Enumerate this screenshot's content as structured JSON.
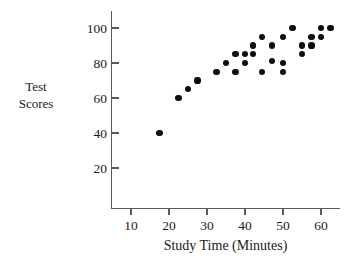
{
  "chart_data": {
    "type": "scatter",
    "title": "",
    "xlabel": "Study Time (Minutes)",
    "ylabel": "Test Scores",
    "ylabel_lines": [
      "Test",
      "Scores"
    ],
    "xlim": [
      0,
      64
    ],
    "ylim": [
      0,
      108
    ],
    "xticks": [
      10,
      20,
      30,
      40,
      50,
      60
    ],
    "xtick_labels": [
      "10",
      "20",
      "30",
      "40",
      "50",
      "60"
    ],
    "yticks": [
      20,
      40,
      60,
      80,
      100
    ],
    "ytick_labels": [
      "20",
      "40",
      "60",
      "80",
      "100"
    ],
    "grid": false,
    "legend": null,
    "marker": "filled-circle",
    "marker_color": "#0d0d0d",
    "axis_color": "#5a5a5a",
    "points": [
      {
        "x": 17.5,
        "y": 40
      },
      {
        "x": 22.5,
        "y": 60
      },
      {
        "x": 25,
        "y": 65
      },
      {
        "x": 27.5,
        "y": 70
      },
      {
        "x": 32.5,
        "y": 75
      },
      {
        "x": 35,
        "y": 80
      },
      {
        "x": 37.5,
        "y": 85
      },
      {
        "x": 37.5,
        "y": 75
      },
      {
        "x": 40,
        "y": 85
      },
      {
        "x": 40,
        "y": 80
      },
      {
        "x": 42,
        "y": 85
      },
      {
        "x": 42,
        "y": 90
      },
      {
        "x": 44.5,
        "y": 95
      },
      {
        "x": 44.5,
        "y": 75
      },
      {
        "x": 47,
        "y": 90
      },
      {
        "x": 47,
        "y": 81
      },
      {
        "x": 50,
        "y": 95
      },
      {
        "x": 50,
        "y": 80
      },
      {
        "x": 50,
        "y": 75
      },
      {
        "x": 52.5,
        "y": 100
      },
      {
        "x": 55,
        "y": 90
      },
      {
        "x": 55,
        "y": 85
      },
      {
        "x": 57.5,
        "y": 95
      },
      {
        "x": 57.5,
        "y": 90
      },
      {
        "x": 60,
        "y": 100
      },
      {
        "x": 60,
        "y": 95
      },
      {
        "x": 62.5,
        "y": 100
      }
    ]
  }
}
